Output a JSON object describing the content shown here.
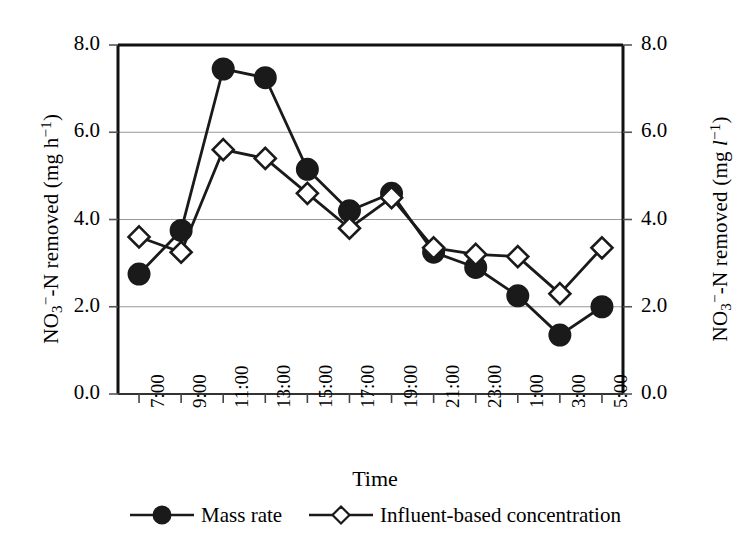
{
  "chart_data": {
    "type": "line",
    "title": "",
    "xlabel": "Time",
    "ylabel": "NO3--N removed (mg h-1)",
    "ylabel_right": "NO3--N removed (mg l-1)",
    "categories": [
      "7:00",
      "9:00",
      "11:00",
      "13:00",
      "15:00",
      "17:00",
      "19:00",
      "21:00",
      "23:00",
      "1:00",
      "3:00",
      "5:00"
    ],
    "ylim": [
      0.0,
      8.0
    ],
    "ytick_labels": [
      "0.0",
      "2.0",
      "4.0",
      "6.0",
      "8.0"
    ],
    "ytick_values": [
      0.0,
      2.0,
      4.0,
      6.0,
      8.0
    ],
    "ytick_labels_right": [
      "0.0",
      "2.0",
      "4.0",
      "6.0",
      "8.0"
    ],
    "ylim_right": [
      0.0,
      8.0
    ],
    "grid": true,
    "grid_color": "#999999",
    "legend_position": "bottom",
    "series": [
      {
        "name": "Mass rate",
        "marker": "filled-circle",
        "color": "#1a1a1a",
        "axis": "left",
        "values": [
          2.75,
          3.75,
          7.45,
          7.25,
          5.15,
          4.2,
          4.6,
          3.25,
          2.9,
          2.25,
          1.35,
          2.0
        ]
      },
      {
        "name": "Influent-based concentration",
        "marker": "open-diamond",
        "color": "#1a1a1a",
        "axis": "right",
        "values": [
          3.6,
          3.25,
          5.6,
          5.4,
          4.6,
          3.8,
          4.5,
          3.35,
          3.2,
          3.15,
          2.3,
          3.35
        ]
      }
    ]
  },
  "axis": {
    "left_title_parts": {
      "pre": "NO",
      "sub": "3",
      "sup": "-",
      "mid": "-N removed (mg h",
      "exp": "-1",
      "post": ")"
    },
    "right_title_parts": {
      "pre": "NO",
      "sub": "3",
      "sup": "-",
      "mid": "-N removed (mg ",
      "unit": "l",
      "exp": "-1",
      "post": ")"
    }
  },
  "xaxis": {
    "title": "Time"
  },
  "legend": {
    "items": [
      {
        "label": "Mass rate",
        "marker": "filled-circle"
      },
      {
        "label": "Influent-based concentration",
        "marker": "open-diamond"
      }
    ]
  }
}
